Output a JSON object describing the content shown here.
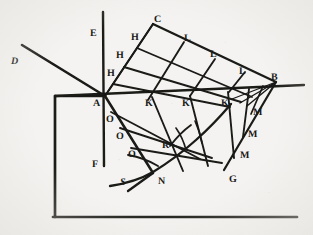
{
  "figure": {
    "kind": "geometric-optics-diagram",
    "caption": "",
    "background_color": "#f4f3f1",
    "ink_color": "#1a1a18",
    "width": 313,
    "height": 235
  },
  "labels": [
    {
      "id": "D",
      "text": "D",
      "x": 11,
      "y": 57,
      "style": "italic"
    },
    {
      "id": "E",
      "text": "E",
      "x": 90,
      "y": 29,
      "style": "roman"
    },
    {
      "id": "C",
      "text": "C",
      "x": 154,
      "y": 15,
      "style": "roman"
    },
    {
      "id": "H1",
      "text": "H",
      "x": 131,
      "y": 33,
      "style": "roman"
    },
    {
      "id": "H2",
      "text": "H",
      "x": 116,
      "y": 51,
      "style": "roman"
    },
    {
      "id": "H3",
      "text": "H",
      "x": 107,
      "y": 69,
      "style": "roman"
    },
    {
      "id": "L1",
      "text": "L",
      "x": 184,
      "y": 34,
      "style": "roman"
    },
    {
      "id": "L2",
      "text": "L",
      "x": 210,
      "y": 50,
      "style": "roman"
    },
    {
      "id": "L3",
      "text": "L",
      "x": 239,
      "y": 67,
      "style": "roman"
    },
    {
      "id": "B",
      "text": "B",
      "x": 271,
      "y": 73,
      "style": "roman"
    },
    {
      "id": "A",
      "text": "A",
      "x": 93,
      "y": 99,
      "style": "roman"
    },
    {
      "id": "K1",
      "text": "K",
      "x": 145,
      "y": 99,
      "style": "roman"
    },
    {
      "id": "K2",
      "text": "K",
      "x": 182,
      "y": 99,
      "style": "roman"
    },
    {
      "id": "K3",
      "text": "K",
      "x": 221,
      "y": 99,
      "style": "roman"
    },
    {
      "id": "O1",
      "text": "O",
      "x": 106,
      "y": 115,
      "style": "roman"
    },
    {
      "id": "O2",
      "text": "O",
      "x": 116,
      "y": 132,
      "style": "roman"
    },
    {
      "id": "O3",
      "text": "O",
      "x": 128,
      "y": 150,
      "style": "roman"
    },
    {
      "id": "M1",
      "text": "M",
      "x": 253,
      "y": 108,
      "style": "roman"
    },
    {
      "id": "M2",
      "text": "M",
      "x": 248,
      "y": 130,
      "style": "roman"
    },
    {
      "id": "M3",
      "text": "M",
      "x": 240,
      "y": 151,
      "style": "roman"
    },
    {
      "id": "R",
      "text": "R",
      "x": 162,
      "y": 141,
      "style": "roman"
    },
    {
      "id": "G",
      "text": "G",
      "x": 229,
      "y": 175,
      "style": "roman"
    },
    {
      "id": "N",
      "text": "N",
      "x": 158,
      "y": 177,
      "style": "roman"
    },
    {
      "id": "S",
      "text": "S",
      "x": 120,
      "y": 178,
      "style": "italic"
    },
    {
      "id": "F",
      "text": "F",
      "x": 92,
      "y": 160,
      "style": "roman"
    }
  ],
  "points": {
    "A": {
      "x": 105,
      "y": 96
    },
    "B": {
      "x": 276,
      "y": 82
    },
    "C": {
      "x": 153,
      "y": 24
    },
    "G": {
      "x": 224,
      "y": 170
    },
    "N": {
      "x": 153,
      "y": 173
    },
    "E_axis_top": {
      "x": 103,
      "y": 12
    },
    "F_axis_bottom": {
      "x": 103,
      "y": 166
    },
    "D_end": {
      "x": 22,
      "y": 45
    },
    "line_left_end": {
      "x": 55,
      "y": 96
    },
    "line_right_end": {
      "x": 304,
      "y": 85
    }
  },
  "strokes": {
    "axis_width": 2.2,
    "grid_width": 1.9,
    "curve_width": 2.0,
    "frame_width": 2.6
  },
  "frame": {
    "left_x": 55,
    "top_y": 96,
    "bottom_y": 217,
    "right_x": 297
  }
}
